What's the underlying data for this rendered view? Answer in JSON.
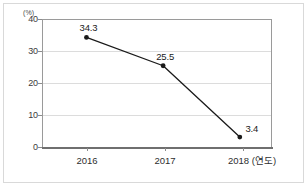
{
  "chart_data": {
    "type": "line",
    "title": "",
    "xlabel": "",
    "ylabel": "",
    "y_unit_label": "(%)",
    "x_axis_unit": "(연도)",
    "categories": [
      "2016",
      "2017",
      "2018"
    ],
    "values": [
      34.3,
      25.5,
      3.4
    ],
    "series": [
      {
        "name": "",
        "values": [
          34.3,
          25.5,
          3.4
        ],
        "point_labels": [
          "34.3",
          "25.5",
          "3.4"
        ],
        "color": "#1a1a1a",
        "marker": "circle"
      }
    ],
    "ylim": [
      0,
      40
    ],
    "y_ticks": [
      40,
      30,
      20,
      10,
      0
    ],
    "y_tick_labels": [
      "40",
      "30",
      "20",
      "10",
      "0"
    ],
    "x_tick_labels": [
      "2016",
      "2017",
      "2018 (연도)"
    ],
    "grid": true,
    "grid_axis": "y",
    "legend": false,
    "legend_position": "none",
    "colors": {
      "line": "#1a1a1a",
      "marker": "#000000",
      "gridline": "#dcdcdc",
      "plot_border": "#9a9a9a",
      "axis": "#6f6f6f",
      "outer_frame": "#d9d9d9",
      "text": "#2e2e2e",
      "background": "#ffffff"
    }
  }
}
